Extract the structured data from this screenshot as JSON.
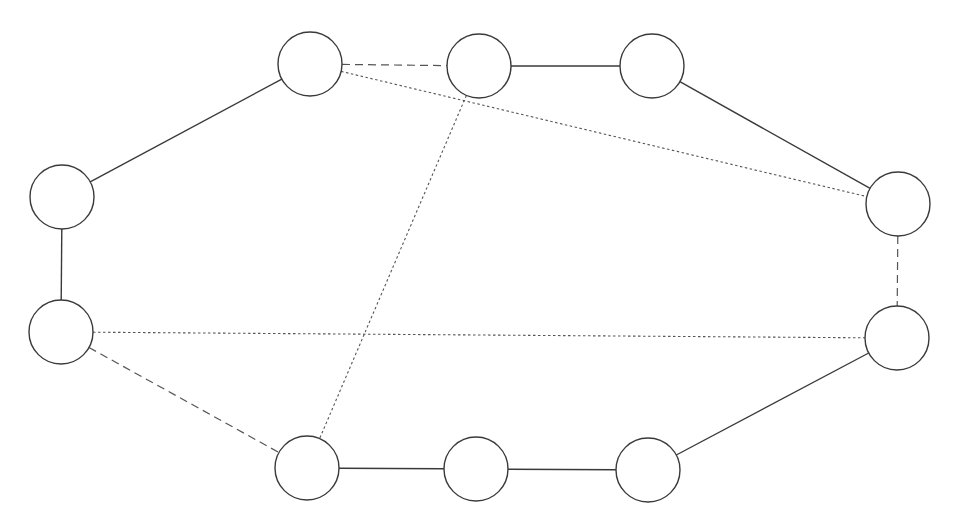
{
  "diagram": {
    "type": "graph",
    "node_radius": 32,
    "colors": {
      "stroke": "#3a3a3a",
      "fill": "#ffffff",
      "background": "#ffffff"
    },
    "nodes": [
      {
        "id": "n1",
        "x": 310,
        "y": 64
      },
      {
        "id": "n2",
        "x": 479,
        "y": 66
      },
      {
        "id": "n3",
        "x": 652,
        "y": 66
      },
      {
        "id": "n4",
        "x": 62,
        "y": 197
      },
      {
        "id": "n5",
        "x": 61,
        "y": 332
      },
      {
        "id": "n6",
        "x": 898,
        "y": 204
      },
      {
        "id": "n7",
        "x": 897,
        "y": 338
      },
      {
        "id": "n8",
        "x": 307,
        "y": 468
      },
      {
        "id": "n9",
        "x": 476,
        "y": 469
      },
      {
        "id": "n10",
        "x": 648,
        "y": 470
      }
    ],
    "edges": [
      {
        "from": "n1",
        "to": "n4",
        "style": "solid"
      },
      {
        "from": "n4",
        "to": "n5",
        "style": "solid"
      },
      {
        "from": "n2",
        "to": "n3",
        "style": "solid"
      },
      {
        "from": "n3",
        "to": "n6",
        "style": "solid"
      },
      {
        "from": "n7",
        "to": "n10",
        "style": "solid"
      },
      {
        "from": "n8",
        "to": "n9",
        "style": "solid"
      },
      {
        "from": "n9",
        "to": "n10",
        "style": "solid"
      },
      {
        "from": "n1",
        "to": "n2",
        "style": "dashed"
      },
      {
        "from": "n6",
        "to": "n7",
        "style": "dashed"
      },
      {
        "from": "n5",
        "to": "n8",
        "style": "dashed"
      },
      {
        "from": "n1",
        "to": "n6",
        "style": "dotted"
      },
      {
        "from": "n2",
        "to": "n8",
        "style": "dotted"
      },
      {
        "from": "n5",
        "to": "n7",
        "style": "dotted"
      }
    ]
  }
}
